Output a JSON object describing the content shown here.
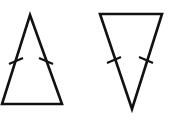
{
  "figure": {
    "title": "Two isosceles triangles with congruence tick marks",
    "background_color": "#ffffff",
    "stroke_color": "#111111",
    "canvas": {
      "width": 186,
      "height": 127
    },
    "shapes": [
      {
        "id": "triangle-left",
        "name": "upward isosceles triangle",
        "orientation": "apex-up",
        "points": "30,15 62,104 2,104",
        "apex": {
          "x": 30,
          "y": 15
        },
        "base_left": {
          "x": 2,
          "y": 104
        },
        "base_right": {
          "x": 62,
          "y": 104
        },
        "stroke_width": 2.6,
        "tick_count_per_leg": 1,
        "ticks": [
          {
            "id": "tick-left-leg",
            "name": "congruence tick on left leg",
            "x1": 9,
            "y1": 64,
            "x2": 23,
            "y2": 58
          },
          {
            "id": "tick-right-leg",
            "name": "congruence tick on right leg",
            "x1": 39,
            "y1": 58,
            "x2": 53,
            "y2": 64
          }
        ]
      },
      {
        "id": "triangle-right",
        "name": "downward isosceles triangle",
        "orientation": "apex-down",
        "points": "100,14 162,14 132,109",
        "apex": {
          "x": 132,
          "y": 109
        },
        "top_left": {
          "x": 100,
          "y": 14
        },
        "top_right": {
          "x": 162,
          "y": 14
        },
        "stroke_width": 2.6,
        "tick_count_per_leg": 1,
        "ticks": [
          {
            "id": "tick-left-leg",
            "name": "congruence tick on left leg",
            "x1": 107,
            "y1": 63,
            "x2": 121,
            "y2": 57
          },
          {
            "id": "tick-right-leg",
            "name": "congruence tick on right leg",
            "x1": 139,
            "y1": 57,
            "x2": 153,
            "y2": 63
          }
        ]
      }
    ]
  }
}
